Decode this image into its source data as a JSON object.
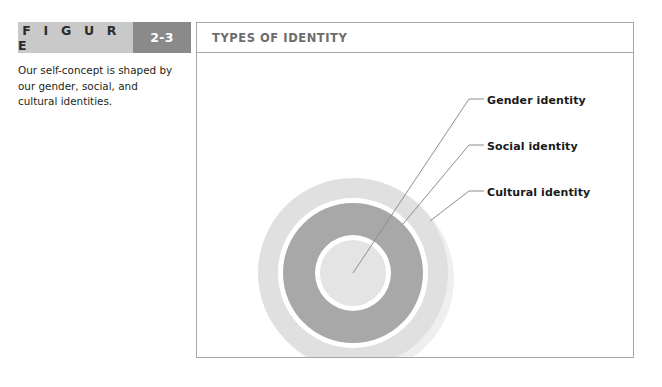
{
  "figure": {
    "word_label": "F I G U R E",
    "number": "2-3",
    "panel_title": "TYPES OF IDENTITY",
    "caption": "Our self-concept is shaped by our gender, social, and cultural identities."
  },
  "colors": {
    "band_light": "#c9c9c9",
    "band_dark": "#8a8a8a",
    "panel_border": "#a7a7a7",
    "panel_title_text": "#6d6d6d",
    "ring_outer": "#e0e0e0",
    "ring_middle": "#a8a8a8",
    "ring_inner": "#e4e4e4",
    "ring_separator": "#ffffff",
    "shadow": "#efefef",
    "leader_line": "#8d8d8d",
    "label_text": "#1a1a1a",
    "body_text": "#231f20"
  },
  "diagram": {
    "type": "concentric-rings",
    "center": {
      "x": 156,
      "y": 220
    },
    "rings": [
      {
        "name": "cultural",
        "label": "Cultural identity",
        "radius": 95,
        "fill": "#e0e0e0"
      },
      {
        "name": "social",
        "label": "Social identity",
        "radius": 70,
        "fill": "#a8a8a8"
      },
      {
        "name": "gender",
        "label": "Gender identity",
        "radius": 33,
        "fill": "#e4e4e4"
      }
    ],
    "shadow_offset": {
      "x": 6,
      "y": 6
    },
    "callouts": [
      {
        "name": "gender",
        "label": "Gender identity",
        "anchor": {
          "x": 156,
          "y": 220
        },
        "elbow": {
          "x": 272,
          "y": 46
        },
        "tip": {
          "x": 287,
          "y": 46
        }
      },
      {
        "name": "social",
        "label": "Social identity",
        "anchor": {
          "x": 206,
          "y": 171
        },
        "elbow": {
          "x": 272,
          "y": 92
        },
        "tip": {
          "x": 287,
          "y": 92
        }
      },
      {
        "name": "cultural",
        "label": "Cultural identity",
        "anchor": {
          "x": 233,
          "y": 168
        },
        "elbow": {
          "x": 272,
          "y": 138
        },
        "tip": {
          "x": 287,
          "y": 138
        }
      }
    ]
  }
}
